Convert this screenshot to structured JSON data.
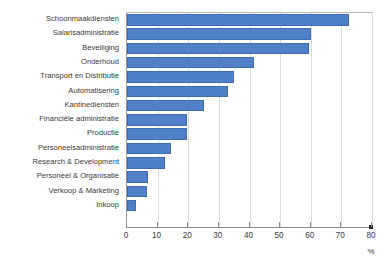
{
  "chart_data": {
    "type": "bar",
    "orientation": "horizontal",
    "title": "",
    "xlabel": "%",
    "ylabel": "",
    "xlim": [
      0,
      80
    ],
    "xticks": [
      0,
      10,
      20,
      30,
      40,
      50,
      60,
      70,
      80
    ],
    "grid": "vertical",
    "legend": "none",
    "bar_color": "#5080c8",
    "bar_edge_color": "#3f6cb0",
    "categories": [
      "Schoonmaakdiensten",
      "Salarisadministratie",
      "Beveiliging",
      "Onderhoud",
      "Transport en Distributie",
      "Automatisering",
      "Kantinediensten",
      "Financiële administratie",
      "Productie",
      "Personeelsadministratie",
      "Research & Development",
      "Personeel & Organisatie",
      "Verkoop & Marketing",
      "Inkoop"
    ],
    "values": [
      72.5,
      60,
      59.5,
      41.5,
      35,
      33,
      25,
      19.5,
      19.5,
      14.5,
      12.5,
      7,
      6.5,
      3
    ]
  }
}
